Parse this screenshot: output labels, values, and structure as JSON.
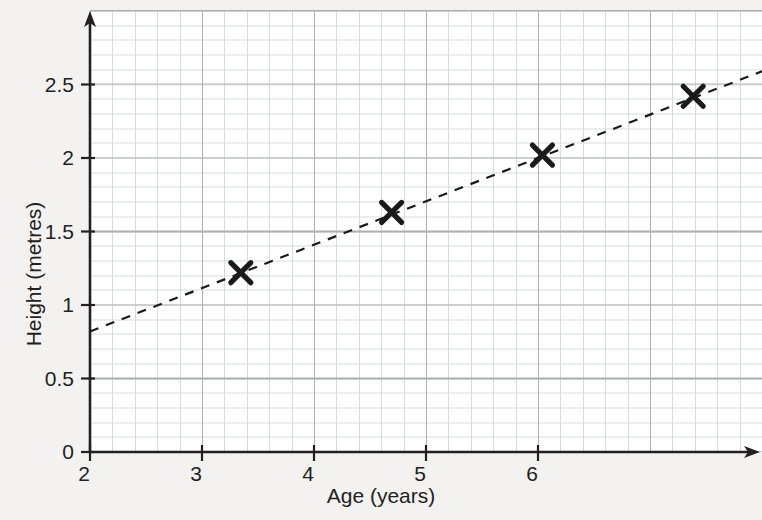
{
  "chart_data": {
    "type": "scatter",
    "title": "",
    "xlabel": "Age (years)",
    "ylabel": "Height (metres)",
    "xlim": [
      2,
      6.6
    ],
    "ylim": [
      0,
      3.0
    ],
    "x_ticks": [
      2,
      3,
      4,
      5,
      6
    ],
    "x_tick_labels": [
      "2",
      "3",
      "4",
      "5",
      "6"
    ],
    "y_ticks": [
      0,
      0.5,
      1,
      1.5,
      2,
      2.5
    ],
    "y_tick_labels": [
      "0",
      "0.5",
      "1",
      "1.5",
      "2",
      "2.5"
    ],
    "grid": true,
    "grid_style": "graph-paper minor and major squares",
    "legend": "none",
    "marker": "x-cross",
    "marker_color": "#1a1a1a",
    "points": [
      {
        "x": 3,
        "y": 1.22
      },
      {
        "x": 4,
        "y": 1.63
      },
      {
        "x": 5,
        "y": 2.02
      },
      {
        "x": 6,
        "y": 2.42
      }
    ],
    "series": [
      {
        "name": "Height vs Age",
        "x": [
          3,
          4,
          5,
          6
        ],
        "values": [
          1.22,
          1.63,
          2.02,
          2.42
        ]
      }
    ],
    "trend_line": {
      "style": "dashed",
      "color": "#1a1a1a",
      "description": "line of best fit",
      "x_start": 2,
      "y_start": 0.82,
      "x_end": 6.6,
      "y_end": 2.59
    },
    "axis_arrows": true,
    "background_color": "#f3f2f0",
    "major_grid_color": "#8e9196",
    "minor_grid_color": "#c9ccd1",
    "axis_color": "#231f20"
  }
}
